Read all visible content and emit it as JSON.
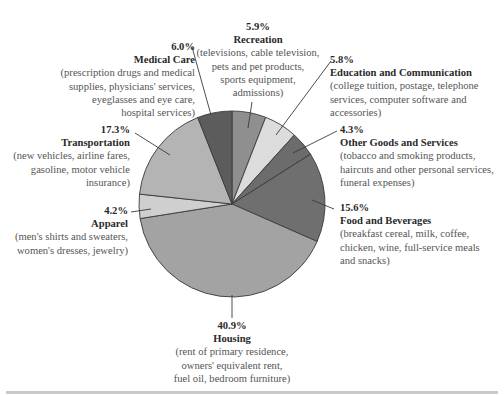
{
  "chart_data": {
    "type": "pie",
    "title": "",
    "start_angle_deg": 0,
    "direction": "clockwise",
    "categories": [
      "Recreation",
      "Education and Communication",
      "Other Goods and Services",
      "Food and Beverages",
      "Housing",
      "Apparel",
      "Transportation",
      "Medical Care"
    ],
    "values": [
      5.9,
      5.8,
      4.3,
      15.6,
      40.9,
      4.2,
      17.3,
      6.0
    ],
    "unit": "%",
    "colors": [
      "#8f8f8f",
      "#dcdcdc",
      "#6c6c6c",
      "#6f6f6f",
      "#a3a3a3",
      "#cfcfcf",
      "#b4b4b4",
      "#5c5c5c"
    ],
    "descriptions": [
      "(televisions, cable television, pets and pet products, sports equipment, admissions)",
      "(college tuition, postage, telephone services, computer software and accessories)",
      "(tobacco and smoking products, haircuts and other personal services, funeral expenses)",
      "(breakfast cereal, milk, coffee, chicken, wine, full-service meals and snacks)",
      "(rent of primary residence, owners' equivalent rent, fuel oil, bedroom furniture)",
      "(men's shirts and sweaters, women's dresses, jewelry)",
      "(new vehicles, airline fares, gasoline, motor vehicle insurance)",
      "(prescription drugs and medical supplies, physicians' services, eyeglasses and eye care, hospital services)"
    ],
    "legend": "none (direct labels with leader lines)"
  },
  "labels": {
    "recreation": {
      "pct": "5.9%",
      "title": "Recreation",
      "desc": [
        "(televisions, cable television,",
        "pets and pet products,",
        "sports equipment,",
        "admissions)"
      ]
    },
    "education": {
      "pct": "5.8%",
      "title": "Education and Communication",
      "desc": [
        "(college tuition, postage, telephone",
        "services, computer software and",
        "accessories)"
      ]
    },
    "other": {
      "pct": "4.3%",
      "title": "Other Goods and Services",
      "desc": [
        "(tobacco and smoking products,",
        "haircuts and other personal services,",
        "funeral expenses)"
      ]
    },
    "food": {
      "pct": "15.6%",
      "title": "Food and Beverages",
      "desc": [
        "(breakfast cereal, milk, coffee,",
        "chicken, wine, full-service meals",
        "and snacks)"
      ]
    },
    "housing": {
      "pct": "40.9%",
      "title": "Housing",
      "desc": [
        "(rent of primary residence,",
        "owners' equivalent rent,",
        "fuel oil, bedroom furniture)"
      ]
    },
    "apparel": {
      "pct": "4.2%",
      "title": "Apparel",
      "desc": [
        "(men's shirts and sweaters,",
        "women's dresses, jewelry)"
      ]
    },
    "transportation": {
      "pct": "17.3%",
      "title": "Transportation",
      "desc": [
        "(new vehicles, airline fares,",
        "gasoline, motor vehicle",
        "insurance)"
      ]
    },
    "medical": {
      "pct": "6.0%",
      "title": "Medical Care",
      "desc": [
        "(prescription drugs and medical",
        "supplies, physicians' services,",
        "eyeglasses and eye care,",
        "hospital services)"
      ]
    }
  }
}
